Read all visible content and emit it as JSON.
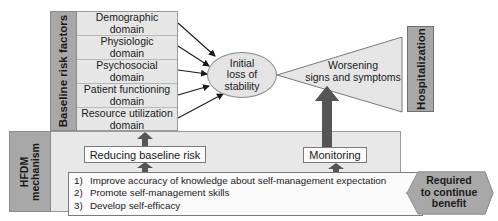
{
  "baseline": {
    "label": "Baseline risk factors",
    "domains": [
      {
        "line1": "Demographic",
        "line2": "domain"
      },
      {
        "line1": "Physiologic",
        "line2": "domain"
      },
      {
        "line1": "Psychosocial",
        "line2": "domain"
      },
      {
        "line1": "Patient functioning",
        "line2": "domain"
      },
      {
        "line1": "Resource utilization",
        "line2": "domain"
      }
    ]
  },
  "stability": {
    "line1": "Initial",
    "line2": "loss of",
    "line3": "stability"
  },
  "worsening": {
    "line1": "Worsening",
    "line2": "signs and symptoms"
  },
  "hospitalization": {
    "label": "Hospitalization"
  },
  "hfdm": {
    "label_line1": "HFDM",
    "label_line2": "mechanism",
    "reducing": "Reducing baseline risk",
    "monitoring": "Monitoring",
    "items": [
      {
        "num": "1)",
        "text": "Improve accuracy of knowledge about self-management expectation"
      },
      {
        "num": "2)",
        "text": "Promote self-management skills"
      },
      {
        "num": "3)",
        "text": "Develop self-efficacy"
      }
    ]
  },
  "outcome": {
    "line1": "Required",
    "line2": "to continue",
    "line3": "benefit"
  },
  "colors": {
    "dark_gray": "#a8a8a8",
    "light_gray": "#e6e6e6",
    "arrow_dark": "#555555",
    "outline": "#7a7a7a"
  }
}
